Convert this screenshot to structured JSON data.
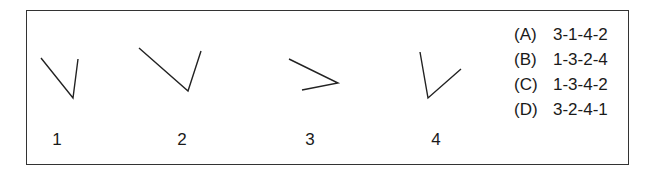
{
  "diagram": {
    "type": "angle-ordering-question",
    "figures": [
      {
        "label": "1",
        "label_x": 57,
        "points": [
          [
            41,
            58
          ],
          [
            73,
            98
          ],
          [
            78,
            59
          ]
        ]
      },
      {
        "label": "2",
        "label_x": 182,
        "points": [
          [
            139,
            48
          ],
          [
            188,
            91
          ],
          [
            201,
            51
          ]
        ]
      },
      {
        "label": "3",
        "label_x": 310,
        "points": [
          [
            289,
            59
          ],
          [
            338,
            83
          ],
          [
            302,
            90
          ]
        ]
      },
      {
        "label": "4",
        "label_x": 436,
        "points": [
          [
            420,
            52
          ],
          [
            428,
            98
          ],
          [
            461,
            69
          ]
        ]
      }
    ],
    "line_color": "#222222",
    "border_color": "#333333"
  },
  "options": [
    {
      "letter": "(A)",
      "value": "3-1-4-2"
    },
    {
      "letter": "(B)",
      "value": "1-3-2-4"
    },
    {
      "letter": "(C)",
      "value": "1-3-4-2"
    },
    {
      "letter": "(D)",
      "value": "3-2-4-1"
    }
  ]
}
